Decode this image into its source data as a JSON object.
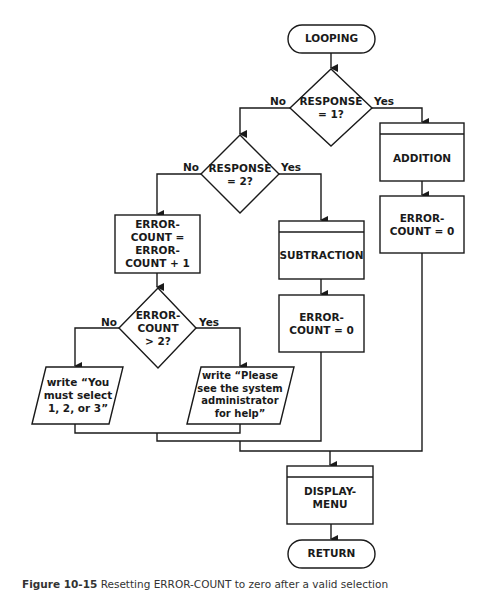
{
  "flowchart": {
    "nodes": {
      "looping": {
        "type": "terminator",
        "label": "LOOPING"
      },
      "response1": {
        "type": "decision",
        "label": "RESPONSE\n= 1?"
      },
      "response2": {
        "type": "decision",
        "label": "RESPONSE\n= 2?"
      },
      "addition": {
        "type": "predefined-process",
        "label": "ADDITION"
      },
      "addition_reset": {
        "type": "process",
        "label": "ERROR-\nCOUNT = 0"
      },
      "subtraction": {
        "type": "predefined-process",
        "label": "SUBTRACTION"
      },
      "subtraction_reset": {
        "type": "process",
        "label": "ERROR-\nCOUNT = 0"
      },
      "increment": {
        "type": "process",
        "label": "ERROR-\nCOUNT =\nERROR-\nCOUNT + 1"
      },
      "errorcheck": {
        "type": "decision",
        "label": "ERROR-\nCOUNT\n> 2?"
      },
      "write_select": {
        "type": "io",
        "label": "write “You\nmust select\n1, 2, or 3”"
      },
      "write_admin": {
        "type": "io",
        "label": "write “Please\nsee the system\nadministrator\nfor help”"
      },
      "display_menu": {
        "type": "predefined-process",
        "label": "DISPLAY-\nMENU"
      },
      "return": {
        "type": "terminator",
        "label": "RETURN"
      }
    },
    "edge_labels": {
      "r1_no": "No",
      "r1_yes": "Yes",
      "r2_no": "No",
      "r2_yes": "Yes",
      "ec_no": "No",
      "ec_yes": "Yes"
    }
  },
  "caption": {
    "figure": "Figure 10-15",
    "text": "Resetting ERROR-COUNT to zero after a valid selection"
  },
  "colors": {
    "stroke": "#1a1a1a",
    "background": "#ffffff"
  }
}
